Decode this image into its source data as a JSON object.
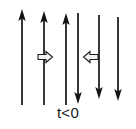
{
  "figure": {
    "caption": "t<0",
    "colors": {
      "line": "#141414",
      "block_arrow_fill": "#f2f2f2",
      "block_arrow_stroke": "#1a1a1a",
      "background": "#ffffff",
      "text": "#1a1a1a"
    },
    "left_group": {
      "name": "upward-field-lines",
      "count": 3,
      "direction": "up",
      "arrowhead_position": "top",
      "x_positions": [
        22,
        44,
        66
      ],
      "y_top": 10,
      "y_bottom": 105
    },
    "right_group": {
      "name": "downward-field-lines",
      "count": 3,
      "direction": "down",
      "arrowhead_position": "bottom",
      "x_positions": [
        78,
        99,
        118
      ],
      "y_top": 12,
      "y_bottom": 104
    },
    "motion_arrows": [
      {
        "name": "left-motion-arrow",
        "direction": "right",
        "glyph": "⇨",
        "x": 45,
        "y": 57
      },
      {
        "name": "right-motion-arrow",
        "direction": "left",
        "glyph": "⇦",
        "x": 91,
        "y": 57
      }
    ]
  }
}
